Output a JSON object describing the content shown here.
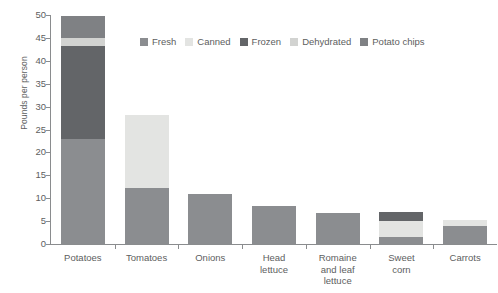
{
  "chart_data": {
    "type": "bar",
    "variant": "stacked-vertical",
    "title": "",
    "subtitle": "",
    "xlabel": "",
    "ylabel": "Pounds per person",
    "ylim": [
      0,
      50
    ],
    "yticks": [
      0,
      5,
      10,
      15,
      20,
      25,
      30,
      35,
      40,
      45,
      50
    ],
    "ytick_labels": [
      "0",
      "5",
      "10",
      "15",
      "20",
      "25",
      "30",
      "35",
      "40",
      "45",
      "50"
    ],
    "grid": false,
    "legend_position": "top-center",
    "categories": [
      "Potatoes",
      "Tomatoes",
      "Onions",
      "Head\nlettuce",
      "Romaine\nand leaf\nlettuce",
      "Sweet\ncorn",
      "Carrots"
    ],
    "series": [
      {
        "name": "Fresh",
        "color": "#8b8d90",
        "values": [
          23.0,
          12.2,
          11.0,
          8.2,
          6.7,
          1.6,
          4.0
        ]
      },
      {
        "name": "Canned",
        "color": "#e3e4e2",
        "values": [
          0,
          16.0,
          0,
          0,
          0,
          3.4,
          1.2
        ]
      },
      {
        "name": "Frozen",
        "color": "#636568",
        "values": [
          20.3,
          0,
          0,
          0,
          0,
          1.9,
          0
        ]
      },
      {
        "name": "Dehydrated",
        "color": "#d2d3d1",
        "values": [
          1.7,
          0,
          0,
          0,
          0,
          0,
          0
        ]
      },
      {
        "name": "Potato chips",
        "color": "#7f8184",
        "values": [
          4.7,
          0,
          0,
          0,
          0,
          0,
          0
        ]
      }
    ],
    "totals": [
      49.7,
      28.2,
      11.0,
      8.2,
      6.7,
      6.9,
      5.2
    ]
  },
  "legend": {
    "items": [
      {
        "label": "Fresh"
      },
      {
        "label": "Canned"
      },
      {
        "label": "Frozen"
      },
      {
        "label": "Dehydrated"
      },
      {
        "label": "Potato chips"
      }
    ]
  },
  "axes": {
    "y_title": "Pounds per person"
  },
  "colors": {
    "fresh": "#8b8d90",
    "canned": "#e3e4e2",
    "frozen": "#636568",
    "dehydrated": "#d2d3d1",
    "potato_chips": "#7f8184",
    "axis": "#8a8c8e",
    "text": "#5d5e60",
    "background": "#ffffff"
  }
}
